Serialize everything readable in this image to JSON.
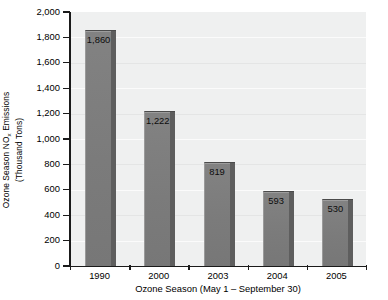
{
  "chart_data": {
    "type": "bar",
    "title": "",
    "categories": [
      "1990",
      "2000",
      "2003",
      "2004",
      "2005"
    ],
    "values": [
      1860,
      1222,
      819,
      530,
      593
    ],
    "value_labels": [
      "1,860",
      "1,222",
      "819",
      "593",
      "530"
    ],
    "series": [
      {
        "name": "Ozone Season NOx Emissions",
        "values": [
          1860,
          1222,
          819,
          593,
          530
        ]
      }
    ],
    "xlabel": "Ozone Season (May 1 – September 30)",
    "ylabel_line1_pre": "Ozone Season NO",
    "ylabel_line1_sub": "x",
    "ylabel_line1_post": " Emissions",
    "ylabel_line2": "(Thousand Tons)",
    "ylim": [
      0,
      2000
    ],
    "ytick_values": [
      0,
      200,
      400,
      600,
      800,
      1000,
      1200,
      1400,
      1600,
      1800,
      2000
    ],
    "ytick_labels": [
      "0",
      "200",
      "400",
      "600",
      "800",
      "1,000",
      "1,200",
      "1,400",
      "1,600",
      "1,800",
      "2,000"
    ],
    "grid": true,
    "grid_axis": "y",
    "legend": "none",
    "bar_color": "#7d7d7d",
    "bar_side_color": "#5e5e5e",
    "plot_background": "#eff0f0",
    "axis_color": "#1a1a1a",
    "page_background": "#ffffff"
  },
  "axes": {
    "y": {
      "ticks": [
        {
          "label": "2,000",
          "value": 2000
        },
        {
          "label": "1,800",
          "value": 1800
        },
        {
          "label": "1,600",
          "value": 1600
        },
        {
          "label": "1,400",
          "value": 1400
        },
        {
          "label": "1,200",
          "value": 1200
        },
        {
          "label": "1,000",
          "value": 1000
        },
        {
          "label": "800",
          "value": 800
        },
        {
          "label": "600",
          "value": 600
        },
        {
          "label": "400",
          "value": 400
        },
        {
          "label": "200",
          "value": 200
        },
        {
          "label": "0",
          "value": 0
        }
      ]
    },
    "x": {
      "ticks": [
        {
          "label": "1990"
        },
        {
          "label": "2000"
        },
        {
          "label": "2003"
        },
        {
          "label": "2004"
        },
        {
          "label": "2005"
        }
      ]
    }
  },
  "bars": [
    {
      "category": "1990",
      "value": 1860,
      "label": "1,860"
    },
    {
      "category": "2000",
      "value": 1222,
      "label": "1,222"
    },
    {
      "category": "2003",
      "value": 819,
      "label": "819"
    },
    {
      "category": "2004",
      "value": 593,
      "label": "593"
    },
    {
      "category": "2005",
      "value": 530,
      "label": "530"
    }
  ]
}
